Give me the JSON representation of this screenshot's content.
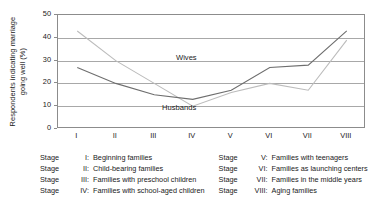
{
  "chart_data": {
    "type": "line",
    "title": "",
    "xlabel": "",
    "ylabel": "Respondents indicating marriage\ngoing well (%)",
    "categories": [
      "I",
      "II",
      "III",
      "IV",
      "V",
      "VI",
      "VII",
      "VIII"
    ],
    "ylim": [
      0,
      50
    ],
    "yticks": [
      0,
      10,
      20,
      30,
      40,
      50
    ],
    "grid": true,
    "legend_position": "inline-annotation",
    "series": [
      {
        "name": "Wives",
        "color": "#bcbcbc",
        "values": [
          43,
          30,
          20,
          10,
          16,
          20,
          17,
          39
        ]
      },
      {
        "name": "Husbands",
        "color": "#6e6e6e",
        "values": [
          27,
          20,
          15,
          13,
          17,
          27,
          28,
          43
        ]
      }
    ],
    "annotations": [
      {
        "text": "Wives",
        "x": 2,
        "y": 36
      },
      {
        "text": "Husbands",
        "x": 1.6,
        "y": 18
      }
    ]
  },
  "axis": {
    "y_label_line1": "Respondents indicating marriage",
    "y_label_line2": "going well (%)",
    "y_ticks": [
      "50",
      "40",
      "30",
      "20",
      "10",
      "0"
    ],
    "x_ticks": [
      "I",
      "II",
      "III",
      "IV",
      "V",
      "VI",
      "VII",
      "VIII"
    ]
  },
  "series_labels": {
    "wives": "Wives",
    "husbands": "Husbands"
  },
  "legend": {
    "left_column": [
      {
        "word": "Stage",
        "numeral": "I:",
        "text": "Beginning families"
      },
      {
        "word": "Stage",
        "numeral": "II:",
        "text": "Child-bearing families"
      },
      {
        "word": "Stage",
        "numeral": "III:",
        "text": "Families with preschool children"
      },
      {
        "word": "Stage",
        "numeral": "IV:",
        "text": "Families with school-aged children"
      }
    ],
    "right_column": [
      {
        "word": "Stage",
        "numeral": "V:",
        "text": "Families with teenagers"
      },
      {
        "word": "Stage",
        "numeral": "VI:",
        "text": "Families as launching centers"
      },
      {
        "word": "Stage",
        "numeral": "VII:",
        "text": "Families in the middle years"
      },
      {
        "word": "Stage",
        "numeral": "VIII:",
        "text": "Aging families"
      }
    ]
  },
  "colors": {
    "wives_line": "#bcbcbc",
    "husbands_line": "#6e6e6e",
    "grid": "#a8a8a8",
    "frame": "#8c8c8c",
    "text": "#1a1a1a"
  }
}
